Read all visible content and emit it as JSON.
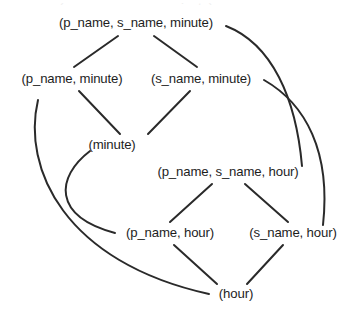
{
  "diagram": {
    "kind": "lattice-hasse-diagram",
    "background_color": "#ffffff",
    "edge_color": "#2a2a2a",
    "text_color": "#1d1d1d",
    "width": 355,
    "height": 315,
    "partial_top_line": "(p_name, s_name, minute)",
    "nodes": [
      {
        "id": "pn_sn_min",
        "label": "(p_name, s_name, minute)",
        "x": 136,
        "y": 23
      },
      {
        "id": "pn_min",
        "label": "(p_name, minute)",
        "x": 72,
        "y": 79
      },
      {
        "id": "sn_min",
        "label": "(s_name, minute)",
        "x": 201,
        "y": 79
      },
      {
        "id": "min",
        "label": "(minute)",
        "x": 112,
        "y": 145
      },
      {
        "id": "pn_sn_hr",
        "label": "(p_name, s_name, hour)",
        "x": 228,
        "y": 172
      },
      {
        "id": "pn_hr",
        "label": "(p_name, hour)",
        "x": 170,
        "y": 233
      },
      {
        "id": "sn_hr",
        "label": "(s_name, hour)",
        "x": 293,
        "y": 233
      },
      {
        "id": "hr",
        "label": "(hour)",
        "x": 236,
        "y": 294
      }
    ],
    "edges": [
      {
        "from": "pn_sn_min",
        "to": "pn_min",
        "style": "straight"
      },
      {
        "from": "pn_sn_min",
        "to": "sn_min",
        "style": "straight"
      },
      {
        "from": "pn_min",
        "to": "min",
        "style": "straight"
      },
      {
        "from": "sn_min",
        "to": "min",
        "style": "straight"
      },
      {
        "from": "pn_sn_hr",
        "to": "pn_hr",
        "style": "straight"
      },
      {
        "from": "pn_sn_hr",
        "to": "sn_hr",
        "style": "straight"
      },
      {
        "from": "pn_hr",
        "to": "hr",
        "style": "straight"
      },
      {
        "from": "sn_hr",
        "to": "hr",
        "style": "straight"
      },
      {
        "from": "pn_sn_min",
        "to": "pn_sn_hr",
        "style": "curved"
      },
      {
        "from": "sn_min",
        "to": "sn_hr",
        "style": "curved"
      },
      {
        "from": "min",
        "to": "pn_hr",
        "style": "curved"
      },
      {
        "from": "pn_min",
        "to": "hr",
        "style": "curved"
      }
    ]
  }
}
